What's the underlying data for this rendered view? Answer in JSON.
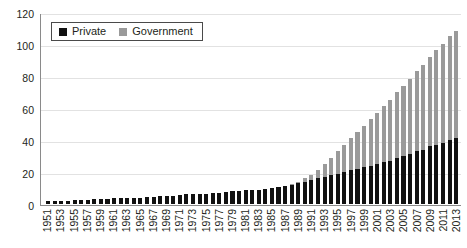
{
  "chart_data": {
    "type": "bar",
    "stacked": true,
    "title": "",
    "xlabel": "",
    "ylabel": "",
    "ylim": [
      0,
      120
    ],
    "ytick_step": 20,
    "yticks": [
      0,
      20,
      40,
      60,
      80,
      100,
      120
    ],
    "grid": true,
    "legend_position": "top-left",
    "colors": {
      "private": "#111111",
      "government": "#9a9a9a",
      "gridline": "#e2e2e2",
      "axis": "#8a8a8a"
    },
    "legend": [
      {
        "label": "Private",
        "color": "#111111",
        "icon": "legend-swatch-private"
      },
      {
        "label": "Government",
        "color": "#9a9a9a",
        "icon": "legend-swatch-government"
      }
    ],
    "x_tick_labels": [
      "1951",
      "1953",
      "1955",
      "1957",
      "1959",
      "1961",
      "1963",
      "1965",
      "1967",
      "1969",
      "1971",
      "1973",
      "1975",
      "1977",
      "1979",
      "1981",
      "1983",
      "1985",
      "1987",
      "1989",
      "1991",
      "1993",
      "1995",
      "1997",
      "1999",
      "2001",
      "2003",
      "2005",
      "2007",
      "2009",
      "2011",
      "2013"
    ],
    "categories": [
      "1951",
      "1952",
      "1953",
      "1954",
      "1955",
      "1956",
      "1957",
      "1958",
      "1959",
      "1960",
      "1961",
      "1962",
      "1963",
      "1964",
      "1965",
      "1966",
      "1967",
      "1968",
      "1969",
      "1970",
      "1971",
      "1972",
      "1973",
      "1974",
      "1975",
      "1976",
      "1977",
      "1978",
      "1979",
      "1980",
      "1981",
      "1982",
      "1983",
      "1984",
      "1985",
      "1986",
      "1987",
      "1988",
      "1989",
      "1990",
      "1991",
      "1992",
      "1993",
      "1994",
      "1995",
      "1996",
      "1997",
      "1998",
      "1999",
      "2000",
      "2001",
      "2002",
      "2003",
      "2004",
      "2005",
      "2006",
      "2007",
      "2008",
      "2009",
      "2010",
      "2011",
      "2012",
      "2013"
    ],
    "series": [
      {
        "name": "Private",
        "color": "#111111",
        "values": [
          2,
          2,
          2,
          2,
          2.5,
          2.5,
          2.5,
          3,
          3,
          3,
          3.5,
          3.5,
          4,
          4,
          4,
          4.5,
          4.5,
          5,
          5,
          5,
          5.5,
          6,
          6,
          6.5,
          6.5,
          7,
          7,
          7.5,
          8,
          8,
          8.5,
          9,
          9,
          9.5,
          10,
          10.5,
          11,
          12,
          13,
          14,
          15,
          16,
          17,
          18,
          19,
          20,
          21,
          22,
          23,
          24,
          25,
          26,
          27,
          29,
          30,
          31,
          33,
          34,
          36,
          37,
          38,
          40,
          41
        ]
      },
      {
        "name": "Government",
        "color": "#9a9a9a",
        "values": [
          0,
          0,
          0,
          0,
          0,
          0,
          0,
          0,
          0,
          0,
          0,
          0,
          0,
          0,
          0,
          0,
          0,
          0,
          0,
          0,
          0,
          0,
          0,
          0,
          0,
          0,
          0,
          0,
          0,
          0,
          0,
          0,
          0,
          0,
          0,
          0,
          0,
          0.5,
          1,
          2,
          3,
          5,
          8,
          11,
          14,
          17,
          20,
          23,
          26,
          29,
          32,
          35,
          38,
          41,
          44,
          47,
          50,
          53,
          56,
          59,
          62,
          65,
          67
        ]
      }
    ]
  }
}
